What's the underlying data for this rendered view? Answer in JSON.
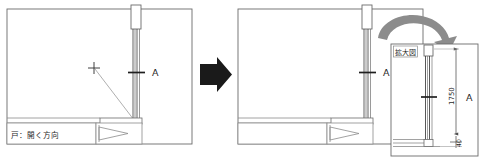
{
  "document": {
    "kind": "architectural-cad-drawing",
    "description": "Door plan detail before and after, with enlarged detail view"
  },
  "transition": {
    "arrow_glyph": "➡",
    "arrow_name": "black-right-arrow",
    "color": "#1a1a1a"
  },
  "left_panel": {
    "name": "before-plan-view",
    "legend_label": "戸：開く方向",
    "section_label": "A",
    "crosshair_label": "+"
  },
  "right_panel": {
    "name": "after-plan-view",
    "section_label": "A",
    "curved_arrow_name": "curved-zoom-arrow",
    "curved_arrow_color": "#8c8c8c"
  },
  "detail_panel": {
    "name": "enlarged-detail-view",
    "title": "拡大図",
    "section_label": "A",
    "dimensions": [
      {
        "value": "1750",
        "orientation": "vertical",
        "name": "overall-height-dimension"
      },
      {
        "value": "40",
        "orientation": "vertical",
        "name": "sill-height-dimension"
      }
    ]
  },
  "style": {
    "line_color": "#4d4d4d",
    "light_line_color": "#9a9a9a",
    "dark_line_color": "#1f1f1f",
    "background": "#ffffff"
  }
}
